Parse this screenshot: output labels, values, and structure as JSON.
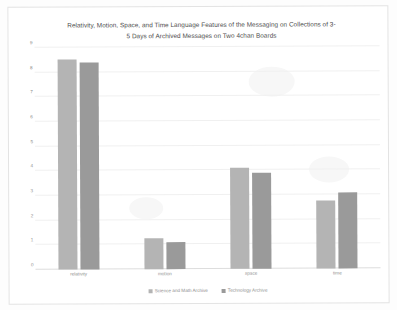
{
  "chart_data": {
    "type": "bar",
    "title_line1": "Relativity, Motion, Space, and Time Language Features of the Messaging on Collections of 3-",
    "title_line2": "5 Days of Archived Messages on Two 4chan Boards",
    "xlabel": "",
    "ylabel": "",
    "categories": [
      "relativity",
      "motion",
      "space",
      "time"
    ],
    "series": [
      {
        "name": "Science and Math Archive",
        "color": "#b4b4b4",
        "values": [
          8.5,
          1.25,
          4.1,
          2.75
        ]
      },
      {
        "name": "Technology Archive",
        "color": "#9a9a9a",
        "values": [
          8.4,
          1.1,
          3.9,
          3.1
        ]
      }
    ],
    "ylim": [
      0,
      9
    ],
    "y_ticks": [
      0,
      1,
      2,
      3,
      4,
      5,
      6,
      7,
      8,
      9
    ],
    "y_tick_labels": [
      "0",
      "1",
      "2",
      "3",
      "4",
      "5",
      "6",
      "7",
      "8",
      "9"
    ],
    "grid": true,
    "grid_axis": "y",
    "legend_position": "bottom",
    "background_color": "#ffffff",
    "frame_color": "#e3e3e3"
  }
}
